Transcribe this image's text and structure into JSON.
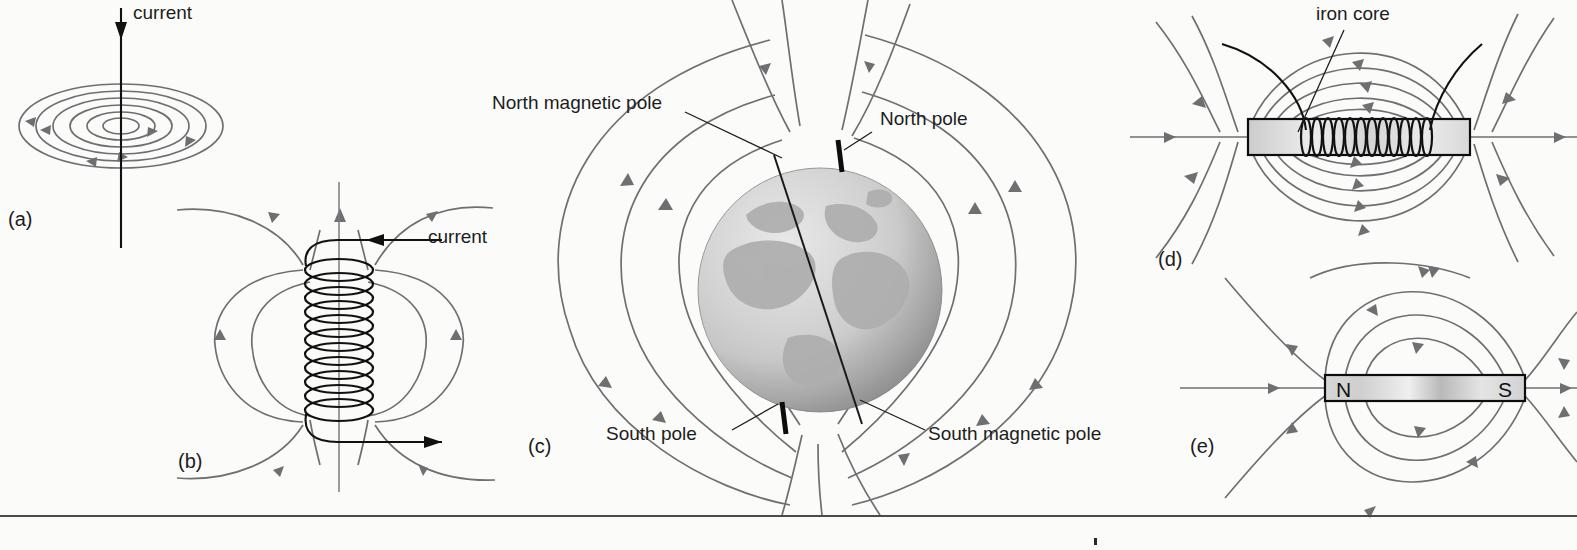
{
  "figure": {
    "background_color": "#fbfbfa",
    "field_line_color": "#6f6f72",
    "wire_color": "#111111",
    "text_color": "#1d1d1d"
  },
  "panels": [
    {
      "id": "a",
      "label": "(a)",
      "subject": "straight current-carrying wire with circular magnetic field lines",
      "annotations": [
        {
          "name": "current-label-a",
          "text": "current"
        }
      ],
      "field_lines": 6,
      "current_direction": "downward"
    },
    {
      "id": "b",
      "label": "(b)",
      "subject": "solenoid coil with magnetic field loops",
      "annotations": [
        {
          "name": "current-label-b",
          "text": "current"
        }
      ],
      "coil_turns": 11,
      "current_direction": "in at top, out at bottom"
    },
    {
      "id": "c",
      "label": "(c)",
      "subject": "Earth's magnetic field (globe with dipole field lines and tilted magnetic axis)",
      "annotations": [
        {
          "name": "north-magnetic-pole-label",
          "text": "North magnetic pole"
        },
        {
          "name": "north-pole-label",
          "text": "North pole"
        },
        {
          "name": "south-pole-label",
          "text": "South pole"
        },
        {
          "name": "south-magnetic-pole-label",
          "text": "South magnetic pole"
        }
      ]
    },
    {
      "id": "d",
      "label": "(d)",
      "subject": "electromagnet: coil wound on an iron core with dipole field lines",
      "annotations": [
        {
          "name": "iron-core-label",
          "text": "iron core"
        }
      ],
      "coil_turns": 22
    },
    {
      "id": "e",
      "label": "(e)",
      "subject": "bar magnet with dipole field lines",
      "annotations": [
        {
          "name": "north-pole-letter",
          "text": "N"
        },
        {
          "name": "south-pole-letter",
          "text": "S"
        }
      ]
    }
  ]
}
